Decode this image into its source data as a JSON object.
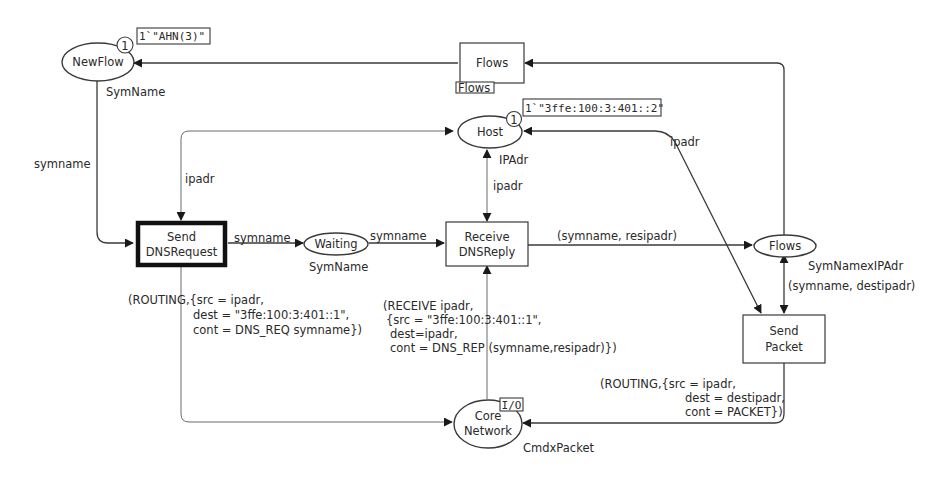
{
  "diagram": {
    "type": "coloured-petri-net",
    "colors": {
      "stroke": "#3a3a3a",
      "text": "#2a2a2a",
      "background": "#ffffff"
    },
    "places": {
      "newflow": {
        "name": "NewFlow",
        "colset": "SymName",
        "token_count": "1",
        "marking": "1`\"AHN(3)\""
      },
      "host": {
        "name": "Host",
        "colset": "IPAdr",
        "token_count": "1",
        "marking": "1`\"3ffe:100:3:401::2\""
      },
      "waiting": {
        "name": "Waiting",
        "colset": "SymName"
      },
      "flows": {
        "name": "Flows",
        "colset": "SymNamexIPAdr"
      },
      "core_network": {
        "name_line1": "Core",
        "name_line2": "Network",
        "colset": "CmdxPacket",
        "port_tag": "I/O"
      }
    },
    "transitions": {
      "flows_sub": {
        "name": "Flows",
        "subpage_tag": "Flows"
      },
      "send_dnsrequest": {
        "name_line1": "Send",
        "name_line2": "DNSRequest",
        "enabled": true
      },
      "receive_dnsreply": {
        "name_line1": "Receive",
        "name_line2": "DNSReply"
      },
      "send_packet": {
        "name_line1": "Send",
        "name_line2": "Packet"
      }
    },
    "arc_inscriptions": {
      "newflow_to_send": "symname",
      "host_to_send": "ipadr",
      "send_to_waiting": "symname",
      "waiting_to_receive": "symname",
      "host_receive": "ipadr",
      "receive_to_flows": "(symname, resipadr)",
      "host_sendpacket": "ipadr",
      "flows_sendpacket": "(symname, destipadr)",
      "send_to_network": [
        "(ROUTING,{src = ipadr,",
        "dest = \"3ffe:100:3:401::1\",",
        "cont = DNS_REQ symname})"
      ],
      "network_to_receive": [
        "(RECEIVE ipadr,",
        "{src = \"3ffe:100:3:401::1\",",
        "dest=ipadr,",
        "cont = DNS_REP (symname,resipadr)})"
      ],
      "sendpacket_to_network": [
        "(ROUTING,{src = ipadr,",
        "dest = destipadr,",
        "cont = PACKET})"
      ]
    }
  }
}
